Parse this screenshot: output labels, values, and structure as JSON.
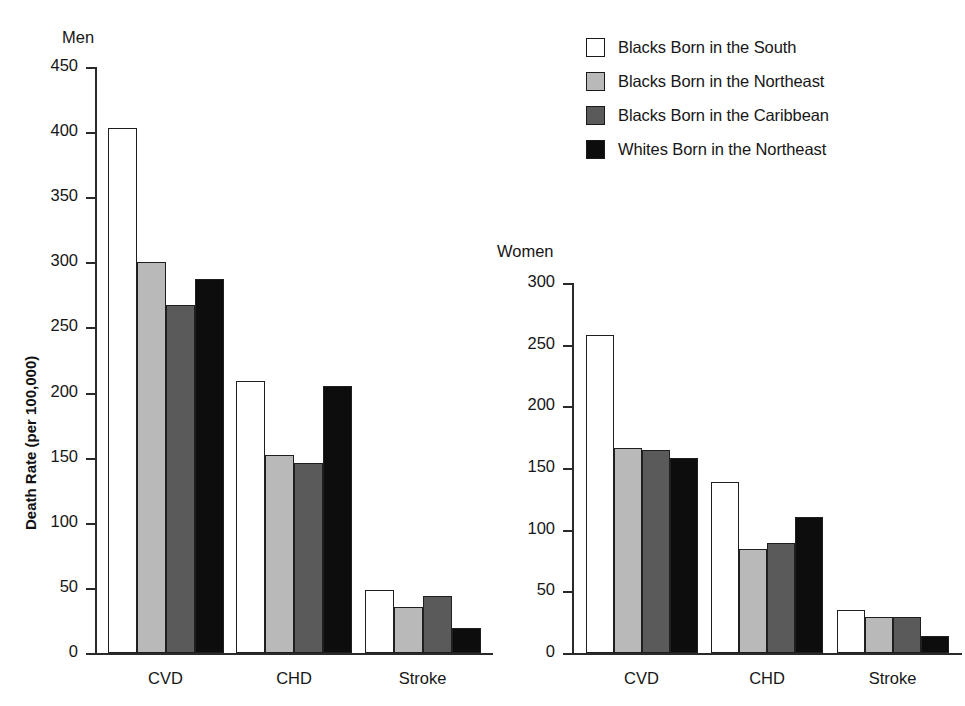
{
  "legend": {
    "items": [
      {
        "label": "Blacks Born in the South",
        "color": "#ffffff",
        "name": "blacks-south"
      },
      {
        "label": "Blacks Born in the Northeast",
        "color": "#b9b9b9",
        "name": "blacks-northeast"
      },
      {
        "label": "Blacks Born in the Caribbean",
        "color": "#5a5a5a",
        "name": "blacks-caribbean"
      },
      {
        "label": "Whites Born in the Northeast",
        "color": "#0d0d0d",
        "name": "whites-northeast"
      }
    ]
  },
  "chart_data": [
    {
      "type": "bar",
      "title": "Men",
      "xlabel": "",
      "ylabel": "Death Rate (per 100,000)",
      "ylim": [
        0,
        450
      ],
      "yticks": [
        0,
        50,
        100,
        150,
        200,
        250,
        300,
        350,
        400,
        450
      ],
      "grid": false,
      "legend_position": "top-right (shared)",
      "categories": [
        "CVD",
        "CHD",
        "Stroke"
      ],
      "series": [
        {
          "name": "Blacks Born in the South",
          "color": "#ffffff",
          "values": [
            403,
            209,
            48
          ]
        },
        {
          "name": "Blacks Born in the Northeast",
          "color": "#b9b9b9",
          "values": [
            300,
            152,
            35
          ]
        },
        {
          "name": "Blacks Born in the Caribbean",
          "color": "#5a5a5a",
          "values": [
            267,
            146,
            44
          ]
        },
        {
          "name": "Whites Born in the Northeast",
          "color": "#0d0d0d",
          "values": [
            287,
            205,
            19
          ]
        }
      ]
    },
    {
      "type": "bar",
      "title": "Women",
      "xlabel": "",
      "ylabel": "",
      "ylim": [
        0,
        300
      ],
      "yticks": [
        0,
        50,
        100,
        150,
        200,
        250,
        300
      ],
      "grid": false,
      "legend_position": "top-right (shared)",
      "categories": [
        "CVD",
        "CHD",
        "Stroke"
      ],
      "series": [
        {
          "name": "Blacks Born in the South",
          "color": "#ffffff",
          "values": [
            258,
            139,
            35
          ]
        },
        {
          "name": "Blacks Born in the Northeast",
          "color": "#b9b9b9",
          "values": [
            166,
            84,
            29
          ]
        },
        {
          "name": "Blacks Born in the Caribbean",
          "color": "#5a5a5a",
          "values": [
            165,
            89,
            29
          ]
        },
        {
          "name": "Whites Born in the Northeast",
          "color": "#0d0d0d",
          "values": [
            158,
            110,
            14
          ]
        }
      ]
    }
  ]
}
